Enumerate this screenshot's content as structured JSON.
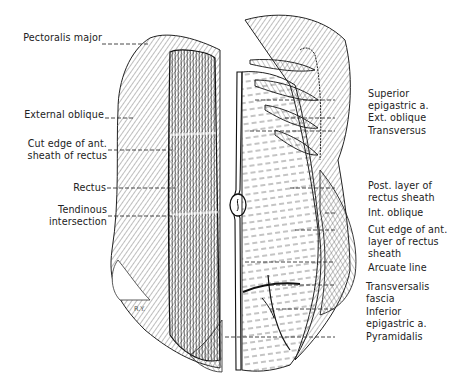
{
  "figure": {
    "signature": "R.Y.",
    "left_labels": [
      {
        "id": "pectoralis-major",
        "text": "Pectoralis major",
        "y": 38
      },
      {
        "id": "external-oblique",
        "text": "External oblique",
        "y": 115
      },
      {
        "id": "cut-edge-ant-sheath",
        "line1": "Cut edge of ant.",
        "line2": "sheath of rectus",
        "y": 143
      },
      {
        "id": "rectus",
        "text": "Rectus",
        "y": 185
      },
      {
        "id": "tendinous-intersection",
        "line1": "Tendinous",
        "line2": "intersection",
        "y": 208
      }
    ],
    "right_labels": [
      {
        "id": "superior-epigastric",
        "line1": "Superior",
        "line2": "epigastric a.",
        "y": 93
      },
      {
        "id": "ext-oblique",
        "text": "Ext. oblique",
        "y": 118
      },
      {
        "id": "transversus",
        "text": "Transversus",
        "y": 131
      },
      {
        "id": "post-layer-rectus-sheath",
        "line1": "Post. layer of",
        "line2": "rectus sheath",
        "y": 181
      },
      {
        "id": "int-oblique",
        "text": "Int. oblique",
        "y": 209
      },
      {
        "id": "cut-edge-ant-layer",
        "line1": "Cut edge of ant.",
        "line2": "layer of rectus",
        "line3": "sheath",
        "y": 224
      },
      {
        "id": "arcuate-line",
        "text": "Arcuate line",
        "y": 262
      },
      {
        "id": "transversalis-fascia",
        "line1": "Transversalis",
        "line2": "fascia",
        "y": 285
      },
      {
        "id": "inferior-epigastric",
        "line1": "Inferior",
        "line2": "epigastric a.",
        "y": 309
      },
      {
        "id": "pyramidalis",
        "text": "Pyramidalis",
        "y": 334
      }
    ]
  }
}
